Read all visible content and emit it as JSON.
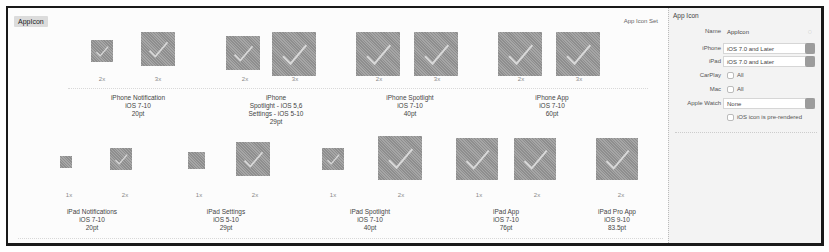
{
  "set": {
    "name": "AppIcon",
    "kind_label": "App Icon Set"
  },
  "groups": [
    {
      "title": [
        "iPhone Notification",
        "iOS 7-10",
        "20pt"
      ],
      "slots": [
        {
          "scale": "2x",
          "size": 22
        },
        {
          "scale": "3x",
          "size": 34
        }
      ]
    },
    {
      "title": [
        "iPhone",
        "Spotlight - iOS 5,6",
        "Settings - iOS 5-10",
        "29pt"
      ],
      "slots": [
        {
          "scale": "2x",
          "size": 34
        },
        {
          "scale": "3x",
          "size": 44
        }
      ]
    },
    {
      "title": [
        "iPhone Spotlight",
        "iOS 7-10",
        "40pt"
      ],
      "slots": [
        {
          "scale": "2x",
          "size": 44
        },
        {
          "scale": "3x",
          "size": 44
        }
      ]
    },
    {
      "title": [
        "iPhone App",
        "iOS 7-10",
        "60pt"
      ],
      "slots": [
        {
          "scale": "2x",
          "size": 44
        },
        {
          "scale": "3x",
          "size": 44
        }
      ]
    },
    {
      "title": [
        "iPad Notifications",
        "iOS 7-10",
        "20pt"
      ],
      "slots": [
        {
          "scale": "1x",
          "size": 12
        },
        {
          "scale": "2x",
          "size": 22
        }
      ]
    },
    {
      "title": [
        "iPad Settings",
        "iOS 5-10",
        "29pt"
      ],
      "slots": [
        {
          "scale": "1x",
          "size": 17
        },
        {
          "scale": "2x",
          "size": 34
        }
      ]
    },
    {
      "title": [
        "iPad Spotlight",
        "iOS 7-10",
        "40pt"
      ],
      "slots": [
        {
          "scale": "1x",
          "size": 22
        },
        {
          "scale": "2x",
          "size": 44
        }
      ]
    },
    {
      "title": [
        "iPad App",
        "iOS 7-10",
        "76pt"
      ],
      "slots": [
        {
          "scale": "1x",
          "size": 42
        },
        {
          "scale": "2x",
          "size": 42
        }
      ]
    },
    {
      "title": [
        "iPad Pro App",
        "iOS 9-10",
        "83.5pt"
      ],
      "slots": [
        {
          "scale": "2x",
          "size": 42
        }
      ]
    }
  ],
  "inspector": {
    "title": "App Icon",
    "name_label": "Name",
    "name_value": "AppIcon",
    "iphone_label": "iPhone",
    "iphone_value": "iOS 7.0 and Later",
    "ipad_label": "iPad",
    "ipad_value": "iOS 7.0 and Later",
    "carplay_label": "CarPlay",
    "carplay_option": "All",
    "mac_label": "Mac",
    "mac_option": "All",
    "watch_label": "Apple Watch",
    "watch_value": "None",
    "prerendered_label": "iOS icon is pre-rendered"
  }
}
